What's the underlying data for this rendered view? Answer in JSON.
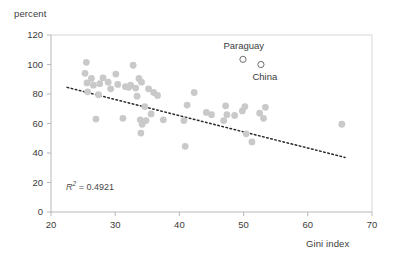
{
  "chart_data": {
    "type": "scatter",
    "title": "",
    "xlabel": "Gini index",
    "ylabel": "percent",
    "xlim": [
      20,
      70
    ],
    "ylim": [
      0,
      120
    ],
    "xticks": [
      20,
      30,
      40,
      50,
      60,
      70
    ],
    "yticks": [
      0,
      20,
      40,
      60,
      80,
      100,
      120
    ],
    "grid": false,
    "legend": "none",
    "annotations": [
      {
        "name": "r2",
        "prefix": "R",
        "sup": "2",
        "eq": " = ",
        "value": "0.4921",
        "x": 26.5,
        "y": 14
      }
    ],
    "marker_color": "#c9c9c9",
    "marker_size": 3.4,
    "series": [
      {
        "name": "countries",
        "marker": "filled-circle",
        "points": [
          [
            25.5,
            101.5
          ],
          [
            25.3,
            94.0
          ],
          [
            25.6,
            87.5
          ],
          [
            25.7,
            81.5
          ],
          [
            26.3,
            90.5
          ],
          [
            26.6,
            86.0
          ],
          [
            27.0,
            63.0
          ],
          [
            27.6,
            87.0
          ],
          [
            27.4,
            79.5
          ],
          [
            28.1,
            91.0
          ],
          [
            28.9,
            88.0
          ],
          [
            29.3,
            83.5
          ],
          [
            30.1,
            93.5
          ],
          [
            30.4,
            86.5
          ],
          [
            31.2,
            63.5
          ],
          [
            31.6,
            85.0
          ],
          [
            32.1,
            84.5
          ],
          [
            32.4,
            86.0
          ],
          [
            32.8,
            99.5
          ],
          [
            33.2,
            84.0
          ],
          [
            33.4,
            78.5
          ],
          [
            33.7,
            90.5
          ],
          [
            33.9,
            62.5
          ],
          [
            34.1,
            88.0
          ],
          [
            34.2,
            59.5
          ],
          [
            34.0,
            53.5
          ],
          [
            34.6,
            71.5
          ],
          [
            34.8,
            62.0
          ],
          [
            35.2,
            83.5
          ],
          [
            35.6,
            66.5
          ],
          [
            36.0,
            81.0
          ],
          [
            36.6,
            79.0
          ],
          [
            37.5,
            62.5
          ],
          [
            40.7,
            62.0
          ],
          [
            40.9,
            44.5
          ],
          [
            41.2,
            72.5
          ],
          [
            42.3,
            81.0
          ],
          [
            44.2,
            67.5
          ],
          [
            45.0,
            66.0
          ],
          [
            46.9,
            62.0
          ],
          [
            47.2,
            72.0
          ],
          [
            47.4,
            66.0
          ],
          [
            48.6,
            65.5
          ],
          [
            49.8,
            68.5
          ],
          [
            50.2,
            71.5
          ],
          [
            50.4,
            53.0
          ],
          [
            51.3,
            47.5
          ],
          [
            52.5,
            67.0
          ],
          [
            53.1,
            63.5
          ],
          [
            53.4,
            71.0
          ],
          [
            65.3,
            59.5
          ]
        ]
      },
      {
        "name": "highlighted",
        "marker": "open-circle",
        "points": [
          {
            "x": 49.9,
            "y": 103.5,
            "label": "Paraguay",
            "label_pos": "above"
          },
          {
            "x": 52.7,
            "y": 100.0,
            "label": "China",
            "label_pos": "below"
          }
        ]
      }
    ],
    "trendline": {
      "type": "dotted-linear",
      "x_start": 22.5,
      "y_start": 84.5,
      "x_end": 65.8,
      "y_end": 37.0,
      "color": "#2b2b2b"
    }
  }
}
